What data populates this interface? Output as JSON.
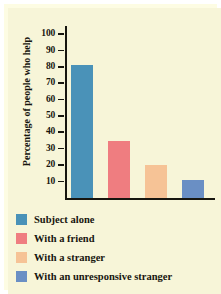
{
  "chart_data": {
    "type": "bar",
    "title": "",
    "xlabel": "",
    "ylabel": "Percentage of people who help",
    "ylim": [
      0,
      105
    ],
    "yticks": [
      100,
      90,
      80,
      70,
      60,
      50,
      40,
      30,
      20,
      10
    ],
    "grid": false,
    "legend_position": "below",
    "categories": [
      "Subject alone",
      "With a friend",
      "With a stranger",
      "With an unresponsive stranger"
    ],
    "values": [
      81,
      35,
      20,
      11
    ],
    "colors": [
      "#4a92b8",
      "#ef7d80",
      "#f6c396",
      "#6a8fc4"
    ]
  },
  "legend": {
    "items": [
      {
        "label": "Subject alone",
        "color": "#4a92b8"
      },
      {
        "label": "With a friend",
        "color": "#ef7d80"
      },
      {
        "label": "With a stranger",
        "color": "#f6c396"
      },
      {
        "label": "With an unresponsive stranger",
        "color": "#6a8fc4"
      }
    ]
  },
  "theme": {
    "background": "#f7f5d8",
    "axis": "#17160f",
    "text": "#17160f"
  }
}
